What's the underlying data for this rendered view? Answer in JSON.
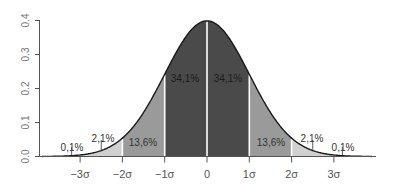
{
  "chart_data": {
    "type": "area",
    "title": "",
    "xlabel": "",
    "ylabel": "",
    "ylim": [
      0.0,
      0.4
    ],
    "y_ticks": [
      "0.0",
      "0.1",
      "0.2",
      "0.3",
      "0.4"
    ],
    "x_ticks": [
      "−3σ",
      "−2σ",
      "−1σ",
      "0",
      "1σ",
      "2σ",
      "3σ"
    ],
    "x_tick_values": [
      -3,
      -2,
      -1,
      0,
      1,
      2,
      3
    ],
    "curve": "standard normal density",
    "regions": [
      {
        "from": -4,
        "to": -3,
        "percent": "0,1%",
        "color": "#f2f2f2"
      },
      {
        "from": -3,
        "to": -2,
        "percent": "2,1%",
        "color": "#d0d0d0"
      },
      {
        "from": -2,
        "to": -1,
        "percent": "13,6%",
        "color": "#9a9a9a"
      },
      {
        "from": -1,
        "to": 0,
        "percent": "34,1%",
        "color": "#4a4a4a"
      },
      {
        "from": 0,
        "to": 1,
        "percent": "34,1%",
        "color": "#4a4a4a"
      },
      {
        "from": 1,
        "to": 2,
        "percent": "13,6%",
        "color": "#9a9a9a"
      },
      {
        "from": 2,
        "to": 3,
        "percent": "2,1%",
        "color": "#d0d0d0"
      },
      {
        "from": 3,
        "to": 4,
        "percent": "0,1%",
        "color": "#f2f2f2"
      }
    ],
    "grid": false,
    "legend": "none"
  }
}
